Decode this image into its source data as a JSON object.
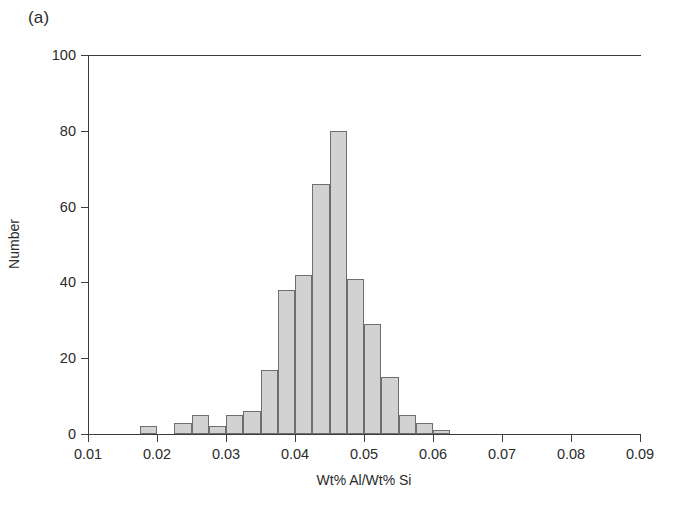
{
  "figure": {
    "panel_label": "(a)",
    "background_color": "#ffffff",
    "bar_fill_color": "#d2d2d2",
    "bar_edge_color": "#6e6e6e",
    "axis_color": "#3d3d3d",
    "text_color": "#2b2b2b"
  },
  "chart_data": {
    "type": "bar",
    "title": "",
    "subtitle": "",
    "panel_label": "(a)",
    "xlabel": "Wt% Al/Wt% Si",
    "ylabel": "Number",
    "xlim": [
      0.01,
      0.09
    ],
    "ylim": [
      0,
      100
    ],
    "xticks": [
      0.01,
      0.02,
      0.03,
      0.04,
      0.05,
      0.06,
      0.07,
      0.08,
      0.09
    ],
    "xtick_labels": [
      "0.01",
      "0.02",
      "0.03",
      "0.04",
      "0.05",
      "0.06",
      "0.07",
      "0.08",
      "0.09"
    ],
    "yticks": [
      0,
      20,
      40,
      60,
      80,
      100
    ],
    "ytick_labels": [
      "0",
      "20",
      "40",
      "60",
      "80",
      "100"
    ],
    "grid": false,
    "legend": null,
    "bin_width": 0.0025,
    "bins": [
      {
        "left": 0.0175,
        "right": 0.02,
        "center": 0.01875,
        "value": 2
      },
      {
        "left": 0.0225,
        "right": 0.025,
        "center": 0.02375,
        "value": 3
      },
      {
        "left": 0.025,
        "right": 0.0275,
        "center": 0.02625,
        "value": 5
      },
      {
        "left": 0.0275,
        "right": 0.03,
        "center": 0.02875,
        "value": 2
      },
      {
        "left": 0.03,
        "right": 0.0325,
        "center": 0.03125,
        "value": 5
      },
      {
        "left": 0.0325,
        "right": 0.035,
        "center": 0.03375,
        "value": 6
      },
      {
        "left": 0.035,
        "right": 0.0375,
        "center": 0.03625,
        "value": 17
      },
      {
        "left": 0.0375,
        "right": 0.04,
        "center": 0.03875,
        "value": 38
      },
      {
        "left": 0.04,
        "right": 0.0425,
        "center": 0.04125,
        "value": 42
      },
      {
        "left": 0.0425,
        "right": 0.045,
        "center": 0.04375,
        "value": 66
      },
      {
        "left": 0.045,
        "right": 0.0475,
        "center": 0.04625,
        "value": 80
      },
      {
        "left": 0.0475,
        "right": 0.05,
        "center": 0.04875,
        "value": 41
      },
      {
        "left": 0.05,
        "right": 0.0525,
        "center": 0.05125,
        "value": 29
      },
      {
        "left": 0.0525,
        "right": 0.055,
        "center": 0.05375,
        "value": 15
      },
      {
        "left": 0.055,
        "right": 0.0575,
        "center": 0.05625,
        "value": 5
      },
      {
        "left": 0.0575,
        "right": 0.06,
        "center": 0.05875,
        "value": 3
      },
      {
        "left": 0.06,
        "right": 0.0625,
        "center": 0.06125,
        "value": 1
      },
      {
        "left": 0.0975,
        "right": 0.1,
        "center": 0.09875,
        "value": 1
      }
    ],
    "categories": [
      "0.01875",
      "0.02375",
      "0.02625",
      "0.02875",
      "0.03125",
      "0.03375",
      "0.03625",
      "0.03875",
      "0.04125",
      "0.04375",
      "0.04625",
      "0.04875",
      "0.05125",
      "0.05375",
      "0.05625",
      "0.05875",
      "0.06125",
      "0.09875"
    ],
    "values": [
      2,
      3,
      5,
      2,
      5,
      6,
      17,
      38,
      42,
      66,
      80,
      41,
      29,
      15,
      5,
      3,
      1,
      1
    ]
  }
}
